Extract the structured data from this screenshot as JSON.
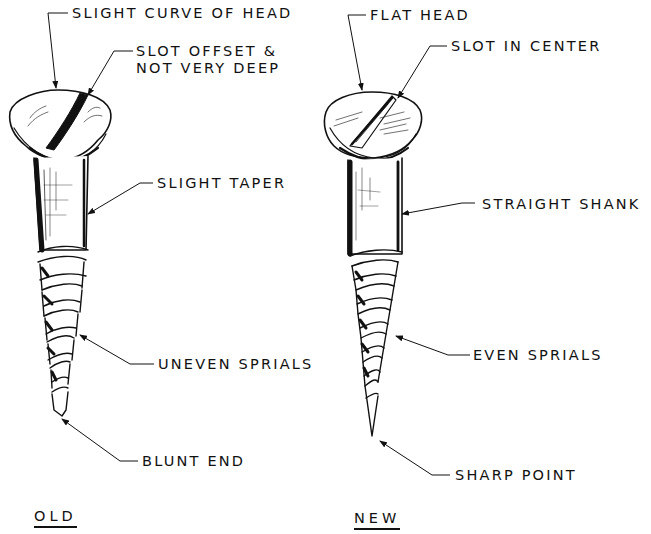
{
  "diagram": {
    "type": "technical-illustration-comparison",
    "colors": {
      "ink": "#111111",
      "background": "#ffffff"
    },
    "old_screw": {
      "caption": "OLD",
      "callouts": [
        {
          "id": "head",
          "text": "SLIGHT CURVE OF HEAD"
        },
        {
          "id": "slot",
          "line1": "SLOT OFFSET &",
          "line2": "NOT VERY DEEP"
        },
        {
          "id": "shank",
          "text": "SLIGHT TAPER"
        },
        {
          "id": "threads",
          "text": "UNEVEN SPRIALS"
        },
        {
          "id": "tip",
          "text": "BLUNT END"
        }
      ]
    },
    "new_screw": {
      "caption": "NEW",
      "callouts": [
        {
          "id": "head",
          "text": "FLAT HEAD"
        },
        {
          "id": "slot",
          "text": "SLOT IN CENTER"
        },
        {
          "id": "shank",
          "text": "STRAIGHT SHANK"
        },
        {
          "id": "threads",
          "text": "EVEN SPRIALS"
        },
        {
          "id": "tip",
          "text": "SHARP POINT"
        }
      ]
    }
  }
}
